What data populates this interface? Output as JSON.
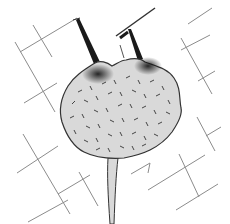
{
  "illustration": {
    "subject": "cell-body with two spike projections and a stalk over grid lines",
    "colors": {
      "background": "#ffffff",
      "body_fill": "#d9d9d9",
      "outline": "#333333",
      "grid_line": "#8c8c8c",
      "stipple": "#222222"
    }
  }
}
